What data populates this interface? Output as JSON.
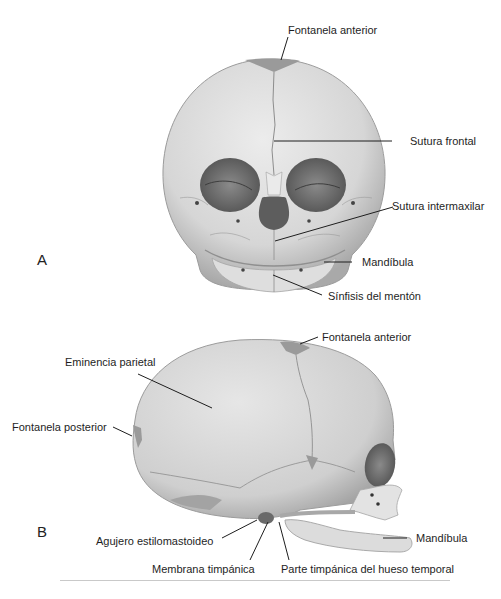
{
  "figure": {
    "panels": [
      {
        "letter": "A",
        "view": "frontal",
        "labels": [
          {
            "text": "Fontanela anterior"
          },
          {
            "text": "Sutura frontal"
          },
          {
            "text": "Sutura intermaxilar"
          },
          {
            "text": "Mandíbula"
          },
          {
            "text": "Sínfisis del mentón"
          }
        ]
      },
      {
        "letter": "B",
        "view": "lateral",
        "labels": [
          {
            "text": "Fontanela anterior"
          },
          {
            "text": "Eminencia parietal"
          },
          {
            "text": "Fontanela posterior"
          },
          {
            "text": "Agujero estilomastoideo"
          },
          {
            "text": "Membrana timpánica"
          },
          {
            "text": "Parte timpánica del hueso temporal"
          },
          {
            "text": "Mandíbula"
          }
        ]
      }
    ],
    "colors": {
      "bone": "#d9d9d9",
      "bone_shadow": "#a8a8a8",
      "fontanel": "#9a9a9a",
      "cavity": "#6e6e6e",
      "leader": "#1e1e1e"
    }
  }
}
